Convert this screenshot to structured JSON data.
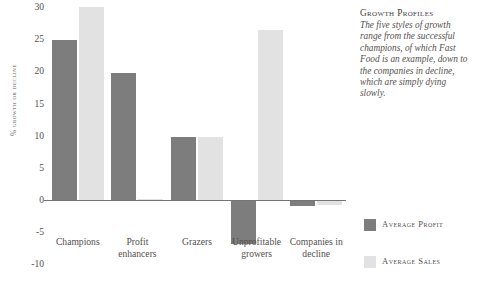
{
  "chart_data": {
    "type": "bar",
    "title": "",
    "xlabel": "",
    "ylabel": "% Growth or Decline",
    "ylim": [
      -10,
      30
    ],
    "yticks": [
      30,
      25,
      20,
      15,
      10,
      5,
      0,
      -5,
      -10
    ],
    "grid": false,
    "legend_position": "right",
    "categories": [
      "Champions",
      "Profit enhancers",
      "Grazers",
      "Unprofitable growers",
      "Companies in decline"
    ],
    "category_lines": [
      [
        "Champions"
      ],
      [
        "Profit",
        "enhancers"
      ],
      [
        "Grazers"
      ],
      [
        "Unprofitable",
        "growers"
      ],
      [
        "Companies in",
        "decline"
      ]
    ],
    "series": [
      {
        "name": "Average Profit",
        "color": "#7d7d7d",
        "values": [
          24.8,
          19.7,
          9.8,
          -6.9,
          -1.0
        ]
      },
      {
        "name": "Average Sales",
        "color": "#e2e2e2",
        "values": [
          30.0,
          0.2,
          9.8,
          26.5,
          -0.8
        ]
      }
    ]
  },
  "legend": {
    "items": [
      {
        "label": "Average Profit",
        "color": "#7d7d7d"
      },
      {
        "label": "Average Sales",
        "color": "#e2e2e2"
      }
    ]
  },
  "sidebar": {
    "title": "Growth Profiles",
    "body": "The five styles of growth range from the successful champions, of which Fast Food is an example, down to the companies in decline, which are simply dying slowly."
  }
}
